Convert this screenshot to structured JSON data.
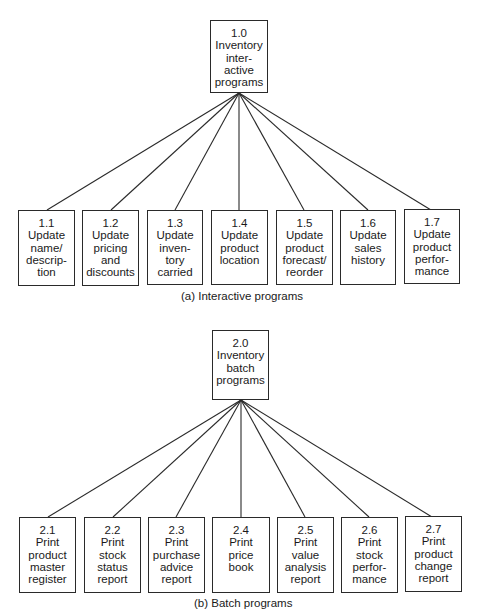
{
  "diagrams": [
    {
      "caption": "(a) Interactive programs",
      "root": {
        "number": "1.0",
        "lines": [
          "Inventory",
          "inter-",
          "active",
          "programs"
        ]
      },
      "children": [
        {
          "number": "1.1",
          "lines": [
            "Update",
            "name/",
            "descrip-",
            "tion"
          ]
        },
        {
          "number": "1.2",
          "lines": [
            "Update",
            "pricing",
            "and",
            "discounts"
          ]
        },
        {
          "number": "1.3",
          "lines": [
            "Update",
            "inven-",
            "tory",
            "carried"
          ]
        },
        {
          "number": "1.4",
          "lines": [
            "Update",
            "product",
            "location",
            ""
          ]
        },
        {
          "number": "1.5",
          "lines": [
            "Update",
            "product",
            "forecast/",
            "reorder"
          ]
        },
        {
          "number": "1.6",
          "lines": [
            "Update",
            "sales",
            "history",
            ""
          ]
        },
        {
          "number": "1.7",
          "lines": [
            "Update",
            "product",
            "perfor-",
            "mance"
          ]
        }
      ]
    },
    {
      "caption": "(b) Batch programs",
      "root": {
        "number": "2.0",
        "lines": [
          "Inventory",
          "batch",
          "programs",
          ""
        ]
      },
      "children": [
        {
          "number": "2.1",
          "lines": [
            "Print",
            "product",
            "master",
            "register"
          ]
        },
        {
          "number": "2.2",
          "lines": [
            "Print",
            "stock",
            "status",
            "report"
          ]
        },
        {
          "number": "2.3",
          "lines": [
            "Print",
            "purchase",
            "advice",
            "report"
          ]
        },
        {
          "number": "2.4",
          "lines": [
            "Print",
            "price",
            "book",
            ""
          ]
        },
        {
          "number": "2.5",
          "lines": [
            "Print",
            "value",
            "analysis",
            "report"
          ]
        },
        {
          "number": "2.6",
          "lines": [
            "Print",
            "stock",
            "perfor-",
            "mance"
          ]
        },
        {
          "number": "2.7",
          "lines": [
            "Print",
            "product",
            "change",
            "report"
          ]
        }
      ]
    }
  ]
}
